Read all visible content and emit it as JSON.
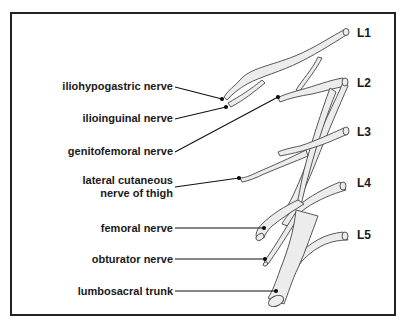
{
  "diagram": {
    "colors": {
      "frame": "#222222",
      "nerve_fill": "#ececec",
      "nerve_outline": "#444444",
      "leader": "#111111",
      "text": "#1a1a1a"
    },
    "levels": [
      {
        "label": "L1",
        "x": 357,
        "y": 26
      },
      {
        "label": "L2",
        "x": 357,
        "y": 76
      },
      {
        "label": "L3",
        "x": 357,
        "y": 125
      },
      {
        "label": "L4",
        "x": 357,
        "y": 176
      },
      {
        "label": "L5",
        "x": 357,
        "y": 228
      }
    ],
    "labels": [
      {
        "id": "iliohypogastric",
        "text": "iliohypogastric nerve",
        "right": 173,
        "y": 80
      },
      {
        "id": "ilioinguinal",
        "text": "ilioinguinal nerve",
        "right": 173,
        "y": 112
      },
      {
        "id": "genitofemoral",
        "text": "genitofemoral nerve",
        "right": 173,
        "y": 145
      },
      {
        "id": "lateral-cutaneous-line1",
        "text": "lateral cutaneous",
        "right": 173,
        "y": 174
      },
      {
        "id": "lateral-cutaneous-line2",
        "text": "nerve of thigh",
        "right": 173,
        "y": 187
      },
      {
        "id": "femoral",
        "text": "femoral nerve",
        "right": 173,
        "y": 222
      },
      {
        "id": "obturator",
        "text": "obturator nerve",
        "right": 173,
        "y": 253
      },
      {
        "id": "lumbosacral",
        "text": "lumbosacral trunk",
        "right": 173,
        "y": 285
      }
    ]
  }
}
